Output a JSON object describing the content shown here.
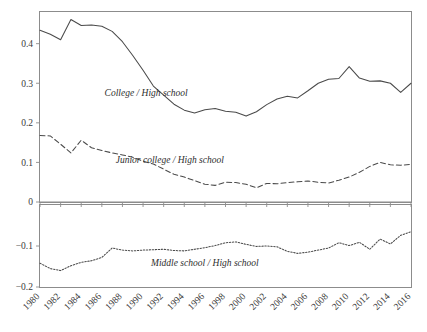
{
  "chart_data": {
    "type": "line",
    "title": "",
    "subtitle": "",
    "xlabel": "",
    "ylabel": "",
    "grid": false,
    "legend_position": "inline-annotations",
    "panels": [
      {
        "name": "upper-panel",
        "ylim": [
          0,
          0.48
        ],
        "yticks": [
          0,
          0.1,
          0.2,
          0.3,
          0.4
        ],
        "ytick_labels": [
          "0",
          "0.1",
          "0.2",
          "0.3",
          "0.4"
        ]
      },
      {
        "name": "lower-panel",
        "ylim": [
          -0.2,
          0
        ],
        "yticks": [
          -0.2,
          -0.1
        ],
        "ytick_labels": [
          "−0.2",
          "−0.1"
        ]
      }
    ],
    "xlim": [
      1980,
      2016
    ],
    "x": [
      1980,
      1981,
      1982,
      1983,
      1984,
      1985,
      1986,
      1987,
      1988,
      1989,
      1990,
      1991,
      1992,
      1993,
      1994,
      1995,
      1996,
      1997,
      1998,
      1999,
      2000,
      2001,
      2002,
      2003,
      2004,
      2005,
      2006,
      2007,
      2008,
      2009,
      2010,
      2011,
      2012,
      2013,
      2014,
      2015,
      2016
    ],
    "xtick_values": [
      1980,
      1982,
      1984,
      1986,
      1988,
      1990,
      1992,
      1994,
      1996,
      1998,
      2000,
      2002,
      2004,
      2006,
      2008,
      2010,
      2012,
      2014,
      2016
    ],
    "xtick_labels": [
      "1980",
      "1982",
      "1984",
      "1986",
      "1988",
      "1990",
      "1992",
      "1994",
      "1996",
      "1998",
      "2000",
      "2002",
      "2004",
      "2006",
      "2008",
      "2010",
      "2012",
      "2014",
      "2016"
    ],
    "series": [
      {
        "name": "College / High school",
        "panel": "upper-panel",
        "style": "solid",
        "label": "College / High school",
        "label_x": 1990.3,
        "label_y": 0.268,
        "values": [
          0.434,
          0.424,
          0.41,
          0.461,
          0.446,
          0.447,
          0.444,
          0.431,
          0.405,
          0.37,
          0.333,
          0.293,
          0.27,
          0.247,
          0.232,
          0.225,
          0.233,
          0.236,
          0.229,
          0.227,
          0.217,
          0.228,
          0.246,
          0.26,
          0.267,
          0.263,
          0.281,
          0.3,
          0.31,
          0.312,
          0.342,
          0.313,
          0.305,
          0.306,
          0.3,
          0.277,
          0.3
        ]
      },
      {
        "name": "Junior college / High school",
        "panel": "upper-panel",
        "style": "dashed",
        "label": "Junior college / High school",
        "label_x": 1992.6,
        "label_y": 0.098,
        "values": [
          0.168,
          0.167,
          0.146,
          0.124,
          0.156,
          0.137,
          0.13,
          0.124,
          0.119,
          0.113,
          0.103,
          0.096,
          0.083,
          0.07,
          0.063,
          0.054,
          0.045,
          0.042,
          0.05,
          0.049,
          0.045,
          0.036,
          0.047,
          0.046,
          0.049,
          0.051,
          0.053,
          0.05,
          0.048,
          0.055,
          0.063,
          0.075,
          0.09,
          0.1,
          0.094,
          0.093,
          0.095
        ]
      },
      {
        "name": "Middle school / High school",
        "panel": "lower-panel",
        "style": "dotted",
        "label": "Middle school / High school",
        "label_x": 1996.0,
        "label_y": -0.148,
        "values": [
          -0.142,
          -0.155,
          -0.16,
          -0.148,
          -0.14,
          -0.136,
          -0.128,
          -0.105,
          -0.11,
          -0.112,
          -0.11,
          -0.109,
          -0.108,
          -0.111,
          -0.112,
          -0.108,
          -0.104,
          -0.099,
          -0.092,
          -0.09,
          -0.096,
          -0.101,
          -0.1,
          -0.102,
          -0.113,
          -0.118,
          -0.115,
          -0.11,
          -0.105,
          -0.092,
          -0.099,
          -0.091,
          -0.108,
          -0.083,
          -0.095,
          -0.074,
          -0.065
        ]
      }
    ],
    "extra_series_points": {
      "college_late": [
        {
          "year": 2006,
          "value": 0.342
        },
        {
          "year": 2011,
          "value": 0.313
        },
        {
          "year": 2016,
          "value": 0.263
        }
      ]
    }
  },
  "accessibility": {
    "description": "Two stacked line panels showing education wage premium ratios from 1980 to 2016."
  },
  "colors": {
    "axis": "#8c8c8c",
    "line": "#4a4a4a",
    "text": "#3a3a3a",
    "background": "#ffffff"
  }
}
